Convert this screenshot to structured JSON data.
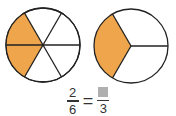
{
  "colors": {
    "shaded": "#EEA54B",
    "unshaded": "#ffffff",
    "stroke": "#222222",
    "placeholder_box": "#B0B0B0"
  },
  "left_circle": {
    "parts": 6,
    "shaded_parts": 2
  },
  "right_circle": {
    "parts": 3,
    "shaded_parts": 1
  },
  "equation": {
    "left_numerator": "2",
    "left_denominator": "6",
    "equals": "=",
    "right_numerator": "",
    "right_denominator": "3"
  }
}
